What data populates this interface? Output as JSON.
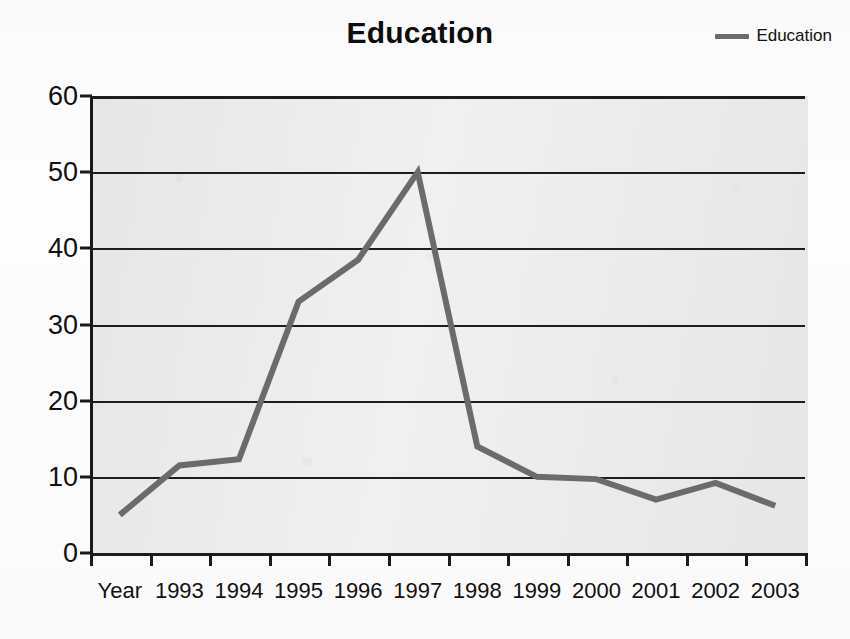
{
  "chart_data": {
    "type": "line",
    "title": "Education",
    "xlabel": "",
    "ylabel": "",
    "categories": [
      "Year",
      "1993",
      "1994",
      "1995",
      "1996",
      "1997",
      "1998",
      "1999",
      "2000",
      "2001",
      "2002",
      "2003"
    ],
    "series": [
      {
        "name": "Education",
        "color": "#6b6b6b",
        "values": [
          5,
          11.5,
          12.3,
          33,
          38.5,
          50,
          14,
          10,
          9.7,
          7,
          9.2,
          6.2
        ]
      }
    ],
    "ylim": [
      0,
      60
    ],
    "yticks": [
      "0",
      "10",
      "20",
      "30",
      "40",
      "50",
      "60"
    ],
    "ytick_values": [
      0,
      10,
      20,
      30,
      40,
      50,
      60
    ],
    "grid": true,
    "legend": {
      "position": "top-right",
      "entries": [
        "Education"
      ]
    },
    "plot_background": "#ebebeb",
    "axis_color": "#1a1a1a"
  },
  "legend": {
    "swatch_name": "line-swatch",
    "label": "Education"
  }
}
